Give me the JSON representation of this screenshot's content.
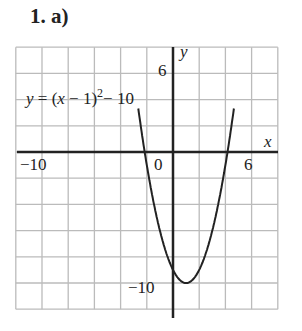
{
  "header": {
    "title": "1.  a)"
  },
  "chart_data": {
    "type": "line",
    "title": "1. a)",
    "equation": "y = (x − 1)² − 10",
    "xlabel": "x",
    "ylabel": "y",
    "xlim": [
      -12,
      8
    ],
    "ylim": [
      -12,
      8
    ],
    "grid": true,
    "grid_step": 2,
    "tick_labels": {
      "x": [
        "−10",
        "0",
        "6"
      ],
      "y": [
        "6",
        "−10"
      ]
    },
    "series": [
      {
        "name": "y = (x − 1)² − 10",
        "vertex": [
          1,
          -10
        ],
        "roots": [
          -2.16,
          4.16
        ],
        "y_intercept": -9,
        "x": [
          -2.5,
          -2,
          -1,
          0,
          1,
          2,
          3,
          4,
          4.5
        ],
        "y": [
          2.25,
          -1,
          -6,
          -9,
          -10,
          -9,
          -6,
          -1,
          2.25
        ]
      }
    ],
    "annotations": [
      "y = (x − 1)² − 10"
    ]
  },
  "labels": {
    "eq_y": "y",
    "eq_rest1": " = (",
    "eq_x": "x",
    "eq_rest2": " − 1)",
    "eq_sup": "2",
    "eq_rest3": "− 10",
    "x_axis": "x",
    "y_axis": "y",
    "x_neg10": "−10",
    "zero": "0",
    "x_6": "6",
    "y_6": "6",
    "y_neg10": "−10"
  }
}
